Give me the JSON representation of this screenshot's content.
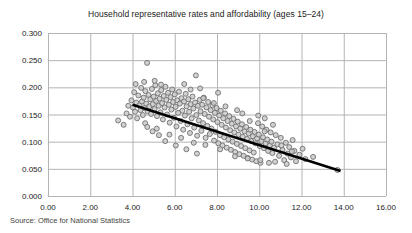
{
  "figure": {
    "title": "Household representative rates and affordability (ages 15–24)",
    "source": "Source: Office for National Statistics"
  },
  "chart_data": {
    "type": "scatter",
    "title": "Household representative rates and affordability (ages 15–24)",
    "xlabel": "",
    "ylabel": "",
    "xlim": [
      0.0,
      16.0
    ],
    "ylim": [
      0.0,
      0.3
    ],
    "xticks": [
      "0.00",
      "2.00",
      "4.00",
      "6.00",
      "8.00",
      "10.00",
      "12.00",
      "14.00",
      "16.00"
    ],
    "yticks": [
      "0.000",
      "0.050",
      "0.100",
      "0.150",
      "0.200",
      "0.250",
      "0.300"
    ],
    "xtick_values": [
      0,
      2,
      4,
      6,
      8,
      10,
      12,
      14,
      16
    ],
    "ytick_values": [
      0.0,
      0.05,
      0.1,
      0.15,
      0.2,
      0.25,
      0.3
    ],
    "grid": true,
    "legend": "none",
    "marker": {
      "shape": "circle",
      "size_px": 5,
      "fill": "#c9c9c9",
      "edge": "#6f6f6f",
      "opacity": 0.85
    },
    "trendline": {
      "type": "linear",
      "color": "#000000",
      "width_px": 2.6,
      "x_start": 4.0,
      "y_start": 0.168,
      "x_end": 13.85,
      "y_end": 0.046,
      "slope": -0.01239,
      "intercept": 0.21755
    },
    "points": [
      [
        3.32,
        0.139
      ],
      [
        3.58,
        0.131
      ],
      [
        3.72,
        0.152
      ],
      [
        3.88,
        0.146
      ],
      [
        3.95,
        0.176
      ],
      [
        4.02,
        0.163
      ],
      [
        4.08,
        0.191
      ],
      [
        4.12,
        0.155
      ],
      [
        4.18,
        0.172
      ],
      [
        4.22,
        0.143
      ],
      [
        4.28,
        0.185
      ],
      [
        4.33,
        0.167
      ],
      [
        4.38,
        0.158
      ],
      [
        4.41,
        0.199
      ],
      [
        4.45,
        0.174
      ],
      [
        4.49,
        0.149
      ],
      [
        4.53,
        0.181
      ],
      [
        4.57,
        0.162
      ],
      [
        4.61,
        0.193
      ],
      [
        4.65,
        0.17
      ],
      [
        4.69,
        0.245
      ],
      [
        4.72,
        0.156
      ],
      [
        4.76,
        0.186
      ],
      [
        4.8,
        0.165
      ],
      [
        4.84,
        0.178
      ],
      [
        4.88,
        0.151
      ],
      [
        4.92,
        0.197
      ],
      [
        4.96,
        0.169
      ],
      [
        5.0,
        0.183
      ],
      [
        5.04,
        0.16
      ],
      [
        5.08,
        0.204
      ],
      [
        5.12,
        0.175
      ],
      [
        5.16,
        0.147
      ],
      [
        5.2,
        0.189
      ],
      [
        5.24,
        0.166
      ],
      [
        5.28,
        0.179
      ],
      [
        5.32,
        0.154
      ],
      [
        5.36,
        0.195
      ],
      [
        5.4,
        0.171
      ],
      [
        5.44,
        0.141
      ],
      [
        5.48,
        0.184
      ],
      [
        5.52,
        0.163
      ],
      [
        5.56,
        0.201
      ],
      [
        5.6,
        0.177
      ],
      [
        5.64,
        0.15
      ],
      [
        5.68,
        0.19
      ],
      [
        5.72,
        0.168
      ],
      [
        5.76,
        0.135
      ],
      [
        5.8,
        0.182
      ],
      [
        5.84,
        0.159
      ],
      [
        5.88,
        0.196
      ],
      [
        5.92,
        0.173
      ],
      [
        5.96,
        0.144
      ],
      [
        6.0,
        0.187
      ],
      [
        6.04,
        0.164
      ],
      [
        6.08,
        0.128
      ],
      [
        6.12,
        0.176
      ],
      [
        6.16,
        0.153
      ],
      [
        6.2,
        0.192
      ],
      [
        6.24,
        0.17
      ],
      [
        6.28,
        0.138
      ],
      [
        6.32,
        0.18
      ],
      [
        6.36,
        0.157
      ],
      [
        6.4,
        0.122
      ],
      [
        6.44,
        0.174
      ],
      [
        6.48,
        0.148
      ],
      [
        6.52,
        0.188
      ],
      [
        6.56,
        0.165
      ],
      [
        6.6,
        0.132
      ],
      [
        6.64,
        0.178
      ],
      [
        6.68,
        0.155
      ],
      [
        6.72,
        0.116
      ],
      [
        6.76,
        0.169
      ],
      [
        6.8,
        0.143
      ],
      [
        6.84,
        0.183
      ],
      [
        6.88,
        0.161
      ],
      [
        6.92,
        0.126
      ],
      [
        6.96,
        0.172
      ],
      [
        7.0,
        0.222
      ],
      [
        7.02,
        0.149
      ],
      [
        7.06,
        0.111
      ],
      [
        7.1,
        0.166
      ],
      [
        7.14,
        0.139
      ],
      [
        7.18,
        0.177
      ],
      [
        7.22,
        0.156
      ],
      [
        7.26,
        0.12
      ],
      [
        7.3,
        0.168
      ],
      [
        7.34,
        0.134
      ],
      [
        7.38,
        0.181
      ],
      [
        7.42,
        0.151
      ],
      [
        7.46,
        0.107
      ],
      [
        7.5,
        0.163
      ],
      [
        7.54,
        0.129
      ],
      [
        7.58,
        0.173
      ],
      [
        7.62,
        0.146
      ],
      [
        7.66,
        0.114
      ],
      [
        7.7,
        0.158
      ],
      [
        7.74,
        0.124
      ],
      [
        7.78,
        0.167
      ],
      [
        7.82,
        0.141
      ],
      [
        7.86,
        0.102
      ],
      [
        7.9,
        0.153
      ],
      [
        7.94,
        0.118
      ],
      [
        7.98,
        0.162
      ],
      [
        8.02,
        0.136
      ],
      [
        8.06,
        0.097
      ],
      [
        8.1,
        0.148
      ],
      [
        8.14,
        0.112
      ],
      [
        8.18,
        0.157
      ],
      [
        8.22,
        0.131
      ],
      [
        8.26,
        0.093
      ],
      [
        8.3,
        0.143
      ],
      [
        8.34,
        0.108
      ],
      [
        8.38,
        0.152
      ],
      [
        8.42,
        0.126
      ],
      [
        8.46,
        0.089
      ],
      [
        8.5,
        0.138
      ],
      [
        8.54,
        0.104
      ],
      [
        8.58,
        0.147
      ],
      [
        8.62,
        0.121
      ],
      [
        8.66,
        0.085
      ],
      [
        8.7,
        0.133
      ],
      [
        8.74,
        0.1
      ],
      [
        8.78,
        0.142
      ],
      [
        8.82,
        0.117
      ],
      [
        8.86,
        0.081
      ],
      [
        8.9,
        0.128
      ],
      [
        8.94,
        0.096
      ],
      [
        8.98,
        0.137
      ],
      [
        9.02,
        0.113
      ],
      [
        9.06,
        0.077
      ],
      [
        9.1,
        0.124
      ],
      [
        9.14,
        0.092
      ],
      [
        9.18,
        0.132
      ],
      [
        9.22,
        0.109
      ],
      [
        9.26,
        0.074
      ],
      [
        9.3,
        0.119
      ],
      [
        9.34,
        0.088
      ],
      [
        9.38,
        0.127
      ],
      [
        9.42,
        0.105
      ],
      [
        9.46,
        0.07
      ],
      [
        9.5,
        0.115
      ],
      [
        9.54,
        0.084
      ],
      [
        9.58,
        0.122
      ],
      [
        9.62,
        0.101
      ],
      [
        9.66,
        0.067
      ],
      [
        9.7,
        0.11
      ],
      [
        9.74,
        0.08
      ],
      [
        9.78,
        0.118
      ],
      [
        9.82,
        0.097
      ],
      [
        9.86,
        0.064
      ],
      [
        9.9,
        0.106
      ],
      [
        9.94,
        0.134
      ],
      [
        9.98,
        0.113
      ],
      [
        10.02,
        0.092
      ],
      [
        10.06,
        0.061
      ],
      [
        10.1,
        0.101
      ],
      [
        10.14,
        0.128
      ],
      [
        10.18,
        0.108
      ],
      [
        10.22,
        0.088
      ],
      [
        10.26,
        0.143
      ],
      [
        10.3,
        0.097
      ],
      [
        10.34,
        0.122
      ],
      [
        10.38,
        0.104
      ],
      [
        10.42,
        0.083
      ],
      [
        10.46,
        0.061
      ],
      [
        10.5,
        0.093
      ],
      [
        10.54,
        0.117
      ],
      [
        10.58,
        0.1
      ],
      [
        10.62,
        0.079
      ],
      [
        10.7,
        0.089
      ],
      [
        10.78,
        0.112
      ],
      [
        10.86,
        0.095
      ],
      [
        10.94,
        0.074
      ],
      [
        11.02,
        0.107
      ],
      [
        11.1,
        0.085
      ],
      [
        11.18,
        0.066
      ],
      [
        11.26,
        0.098
      ],
      [
        11.34,
        0.078
      ],
      [
        11.42,
        0.09
      ],
      [
        11.5,
        0.071
      ],
      [
        11.58,
        0.103
      ],
      [
        11.66,
        0.083
      ],
      [
        11.74,
        0.064
      ],
      [
        11.9,
        0.076
      ],
      [
        12.18,
        0.068
      ],
      [
        12.55,
        0.072
      ],
      [
        13.7,
        0.048
      ],
      [
        5.05,
        0.212
      ],
      [
        5.35,
        0.205
      ],
      [
        6.45,
        0.206
      ],
      [
        4.55,
        0.21
      ],
      [
        7.2,
        0.198
      ],
      [
        8.05,
        0.19
      ],
      [
        6.75,
        0.196
      ],
      [
        9.2,
        0.152
      ],
      [
        9.95,
        0.148
      ],
      [
        10.65,
        0.131
      ],
      [
        4.15,
        0.206
      ],
      [
        3.8,
        0.166
      ],
      [
        4.6,
        0.134
      ],
      [
        5.15,
        0.124
      ],
      [
        5.75,
        0.113
      ],
      [
        6.3,
        0.107
      ],
      [
        6.9,
        0.098
      ],
      [
        7.45,
        0.094
      ],
      [
        8.15,
        0.086
      ],
      [
        8.85,
        0.073
      ],
      [
        9.45,
        0.069
      ],
      [
        10.05,
        0.066
      ],
      [
        10.75,
        0.063
      ],
      [
        11.3,
        0.059
      ],
      [
        7.05,
        0.078
      ],
      [
        6.55,
        0.086
      ],
      [
        6.05,
        0.093
      ],
      [
        5.55,
        0.101
      ],
      [
        5.25,
        0.112
      ],
      [
        4.95,
        0.119
      ],
      [
        4.7,
        0.127
      ],
      [
        8.4,
        0.165
      ],
      [
        8.95,
        0.158
      ],
      [
        7.85,
        0.171
      ],
      [
        7.35,
        0.18
      ],
      [
        9.55,
        0.138
      ],
      [
        10.25,
        0.119
      ],
      [
        11.05,
        0.093
      ],
      [
        11.55,
        0.082
      ],
      [
        12.05,
        0.087
      ]
    ]
  }
}
